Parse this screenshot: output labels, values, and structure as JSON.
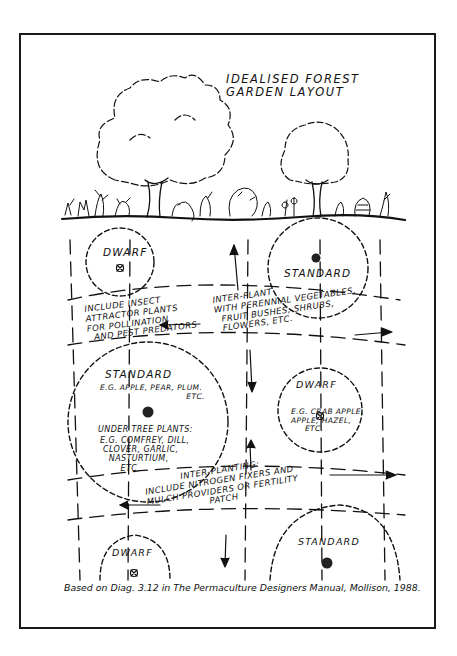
{
  "title": {
    "line1": "Idealised Forest",
    "line2": "Garden Layout"
  },
  "zones": {
    "dwarf_top": {
      "label": "Dwarf"
    },
    "standard_top": {
      "label": "Standard"
    },
    "standard_left": {
      "label": "Standard",
      "examples": "E.G. Apple, Pear, Plum.\n                               Etc.",
      "under_label": "Under Tree Plants:",
      "under_list": "E.G. Comfrey, Dill,\n Clover, Garlic,\n   Nasturtium,\n       Etc."
    },
    "dwarf_right": {
      "label": "Dwarf",
      "examples": "E.G. Crab Apple,\nApple, Hazel,\n     Etc."
    },
    "dwarf_bottom": {
      "label": "Dwarf"
    },
    "standard_bottom": {
      "label": "Standard"
    }
  },
  "notes": {
    "insect": "Include Insect\nAttractor Plants\nFor Pollination\n  And Pest Predators",
    "interplant": "Inter-Plant\nWith Perennial Vegetables,\n  Fruit Bushes, Shrubs,\n  Flowers, Etc.",
    "nitrogen": "            Inter-Planting:\nInclude Nitrogen Fixers And\nMulch Providers Or Fertility\n                    Patch"
  },
  "caption": "Based on Diag. 3.12 in The Permaculture Designers Manual, Mollison, 1988.",
  "colors": {
    "ink": "#111111",
    "paper": "#ffffff",
    "border": "#1a1a1a"
  }
}
